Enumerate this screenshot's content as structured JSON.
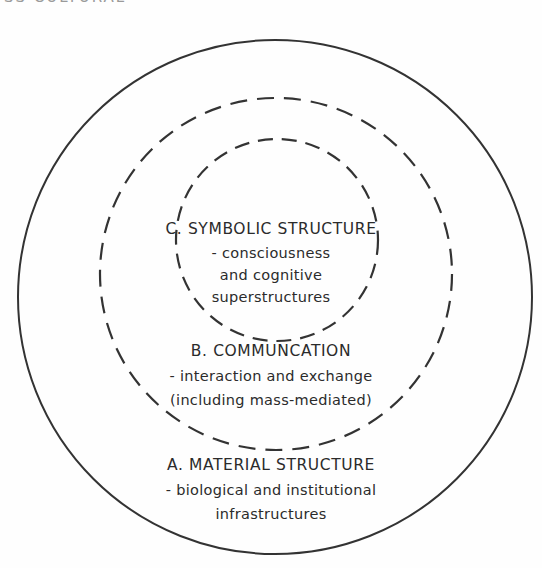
{
  "header": {
    "clipped_text": "SS CULTURAL"
  },
  "diagram": {
    "rings": [
      {
        "name": "outer",
        "cx": 275,
        "cy": 297,
        "r": 257,
        "style": "solid"
      },
      {
        "name": "middle",
        "cx": 276,
        "cy": 274,
        "r": 176,
        "style": "dashed"
      },
      {
        "name": "inner",
        "cx": 277,
        "cy": 240,
        "r": 101,
        "style": "dashed"
      }
    ],
    "stroke_color": "#333333",
    "levels": {
      "c": {
        "title": "C. SYMBOLIC STRUCTURE",
        "lines": [
          "- consciousness",
          "and cognitive",
          "superstructures"
        ]
      },
      "b": {
        "title": "B. COMMUNCATION",
        "lines": [
          "- interaction and exchange",
          "(including mass-mediated)"
        ]
      },
      "a": {
        "title": "A. MATERIAL STRUCTURE",
        "lines": [
          "- biological and institutional",
          "infrastructures"
        ]
      }
    }
  }
}
